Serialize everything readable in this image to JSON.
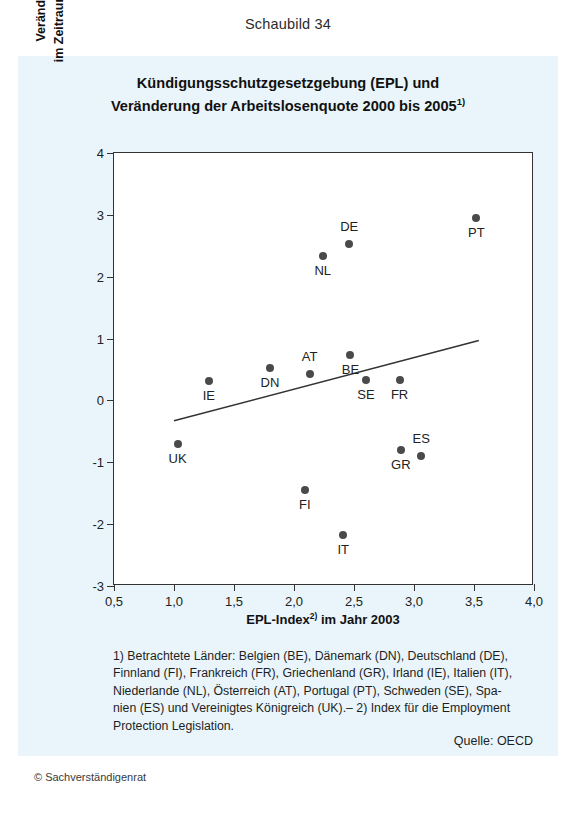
{
  "figure_number": "Schaubild 34",
  "title": {
    "line1": "Kündigungsschutzgesetzgebung (EPL) und",
    "line2_pre": "Veränderung der Arbeitslosenquote 2000 bis 2005",
    "line2_sup": "1)"
  },
  "axes": {
    "y_title_line1": "Veränderung der Arbeitslosenquote",
    "y_title_line2": "im Zeitraum 2000 bis 2005 (Prozentpunkte)",
    "x_title_pre": "EPL-Index",
    "x_title_sup": "2)",
    "x_title_post": " im Jahr 2003"
  },
  "footnote": {
    "line1": "1) Betrachtete Länder: Belgien (BE), Dänemark (DN), Deutschland (DE),",
    "line2": "Finnland (FI), Frankreich (FR), Griechenland (GR), Irland (IE), Italien (IT),",
    "line3": "Niederlande (NL), Österreich (AT), Portugal (PT), Schweden (SE), Spa-",
    "line4": "nien (ES) und Vereinigtes Königreich (UK).– 2) Index für die Employment",
    "line5": "Protection Legislation."
  },
  "source": "Quelle: OECD",
  "copyright": "© Sachverständigenrat",
  "colors": {
    "panel_background": "#e9f5fa",
    "plot_background": "#ffffff",
    "axis": "#333333",
    "point": "#4a4a4a",
    "trendline": "#333333"
  },
  "chart_data": {
    "type": "scatter",
    "title": "Kündigungsschutzgesetzgebung (EPL) und Veränderung der Arbeitslosenquote 2000 bis 2005",
    "xlabel": "EPL-Index im Jahr 2003",
    "ylabel": "Veränderung der Arbeitslosenquote im Zeitraum 2000 bis 2005 (Prozentpunkte)",
    "xlim": [
      0.5,
      4.0
    ],
    "ylim": [
      -3,
      4
    ],
    "xticks": [
      0.5,
      1.0,
      1.5,
      2.0,
      2.5,
      3.0,
      3.5,
      4.0
    ],
    "xticklabels": [
      "0,5",
      "1,0",
      "1,5",
      "2,0",
      "2,5",
      "3,0",
      "3,5",
      "4,0"
    ],
    "yticks": [
      -3,
      -2,
      -1,
      0,
      1,
      2,
      3,
      4
    ],
    "yticklabels": [
      "-3",
      "-2",
      "-1",
      "0",
      "1",
      "2",
      "3",
      "4"
    ],
    "grid": false,
    "legend": false,
    "points": [
      {
        "label": "UK",
        "x": 1.03,
        "y": -0.7,
        "label_dx": 0,
        "label_dy": 14
      },
      {
        "label": "IE",
        "x": 1.29,
        "y": 0.31,
        "label_dx": 0,
        "label_dy": 14
      },
      {
        "label": "DN",
        "x": 1.8,
        "y": 0.52,
        "label_dx": 0,
        "label_dy": 14
      },
      {
        "label": "FI",
        "x": 2.09,
        "y": -1.44,
        "label_dx": 0,
        "label_dy": 14
      },
      {
        "label": "AT",
        "x": 2.13,
        "y": 0.42,
        "label_dx": 0,
        "label_dy": -18
      },
      {
        "label": "NL",
        "x": 2.24,
        "y": 2.34,
        "label_dx": 0,
        "label_dy": 14
      },
      {
        "label": "IT",
        "x": 2.41,
        "y": -2.18,
        "label_dx": 0,
        "label_dy": 14
      },
      {
        "label": "DE",
        "x": 2.46,
        "y": 2.53,
        "label_dx": 0,
        "label_dy": -18
      },
      {
        "label": "BE",
        "x": 2.47,
        "y": 0.73,
        "label_dx": 0,
        "label_dy": 14
      },
      {
        "label": "SE",
        "x": 2.6,
        "y": 0.33,
        "label_dx": 0,
        "label_dy": 14
      },
      {
        "label": "FR",
        "x": 2.88,
        "y": 0.33,
        "label_dx": 0,
        "label_dy": 14
      },
      {
        "label": "GR",
        "x": 2.89,
        "y": -0.8,
        "label_dx": 0,
        "label_dy": 14
      },
      {
        "label": "ES",
        "x": 3.06,
        "y": -0.9,
        "label_dx": 0,
        "label_dy": -18
      },
      {
        "label": "PT",
        "x": 3.52,
        "y": 2.95,
        "label_dx": 0,
        "label_dy": 14
      }
    ],
    "trendline": {
      "x0": 1.0,
      "y0": -0.33,
      "x1": 3.54,
      "y1": 0.97
    }
  }
}
